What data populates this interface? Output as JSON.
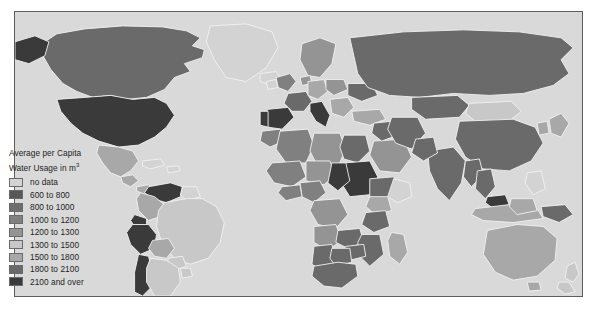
{
  "map": {
    "title_line1": "Average per Capita",
    "title_line2": "Water Usage in m",
    "title_superscript": "3",
    "ocean_color": "#d9d9d9",
    "frame_color": "#5d5d5d",
    "country_border_color": "#f2f2f2"
  },
  "legend": {
    "entries": [
      {
        "label": "no data",
        "color": "#d3d3d3"
      },
      {
        "label": "600 to 800",
        "color": "#585858"
      },
      {
        "label": "800 to 1000",
        "color": "#6e6e6e"
      },
      {
        "label": "1000 to 1200",
        "color": "#808080"
      },
      {
        "label": "1200 to 1300",
        "color": "#949494"
      },
      {
        "label": "1300 to 1500",
        "color": "#c8c8c8"
      },
      {
        "label": "1500 to 1800",
        "color": "#a8a8a8"
      },
      {
        "label": "1800 to 2100",
        "color": "#6a6a6a"
      },
      {
        "label": "2100 and over",
        "color": "#3a3a3a"
      }
    ]
  },
  "chart_data": {
    "type": "map",
    "title": "Average per Capita Water Usage in m3",
    "unit": "m3 per capita per year",
    "projection": "equirectangular-world",
    "classes": [
      {
        "label": "no data",
        "color": "#d3d3d3",
        "min": null,
        "max": null
      },
      {
        "label": "600 to 800",
        "color": "#585858",
        "min": 600,
        "max": 800
      },
      {
        "label": "800 to 1000",
        "color": "#6e6e6e",
        "min": 800,
        "max": 1000
      },
      {
        "label": "1000 to 1200",
        "color": "#808080",
        "min": 1000,
        "max": 1200
      },
      {
        "label": "1200 to 1300",
        "color": "#949494",
        "min": 1200,
        "max": 1300
      },
      {
        "label": "1300 to 1500",
        "color": "#c8c8c8",
        "min": 1300,
        "max": 1500
      },
      {
        "label": "1500 to 1800",
        "color": "#a8a8a8",
        "min": 1500,
        "max": 1800
      },
      {
        "label": "1800 to 2100",
        "color": "#6a6a6a",
        "min": 1800,
        "max": 2100
      },
      {
        "label": "2100 and over",
        "color": "#3a3a3a",
        "min": 2100,
        "max": null
      }
    ],
    "regions": [
      {
        "name": "United States",
        "class": "2100 and over"
      },
      {
        "name": "Canada",
        "class": "1800 to 2100"
      },
      {
        "name": "Mexico",
        "class": "1500 to 1800"
      },
      {
        "name": "Greenland",
        "class": "no data"
      },
      {
        "name": "Brazil",
        "class": "1300 to 1500"
      },
      {
        "name": "Venezuela",
        "class": "2100 and over"
      },
      {
        "name": "Peru",
        "class": "2100 and over"
      },
      {
        "name": "Chile",
        "class": "2100 and over"
      },
      {
        "name": "Argentina",
        "class": "1300 to 1500"
      },
      {
        "name": "Colombia",
        "class": "1500 to 1800"
      },
      {
        "name": "Bolivia",
        "class": "1500 to 1800"
      },
      {
        "name": "Spain",
        "class": "2100 and over"
      },
      {
        "name": "Italy",
        "class": "2100 and over"
      },
      {
        "name": "France",
        "class": "1800 to 2100"
      },
      {
        "name": "Germany",
        "class": "1500 to 1800"
      },
      {
        "name": "United Kingdom",
        "class": "1000 to 1200"
      },
      {
        "name": "Scandinavia",
        "class": "1200 to 1300"
      },
      {
        "name": "Russia",
        "class": "1800 to 2100"
      },
      {
        "name": "China",
        "class": "1800 to 2100"
      },
      {
        "name": "India",
        "class": "1800 to 2100"
      },
      {
        "name": "Mongolia",
        "class": "1300 to 1500"
      },
      {
        "name": "Kazakhstan",
        "class": "1800 to 2100"
      },
      {
        "name": "Japan",
        "class": "1500 to 1800"
      },
      {
        "name": "Indonesia",
        "class": "1500 to 1800"
      },
      {
        "name": "Malaysia",
        "class": "2100 and over"
      },
      {
        "name": "Australia",
        "class": "1500 to 1800"
      },
      {
        "name": "New Zealand",
        "class": "1300 to 1500"
      },
      {
        "name": "Papua New Guinea",
        "class": "1800 to 2100"
      },
      {
        "name": "Sudan",
        "class": "2100 and over"
      },
      {
        "name": "Egypt",
        "class": "1800 to 2100"
      },
      {
        "name": "Algeria",
        "class": "1000 to 1200"
      },
      {
        "name": "Libya",
        "class": "1200 to 1300"
      },
      {
        "name": "Nigeria",
        "class": "1000 to 1200"
      },
      {
        "name": "Ethiopia",
        "class": "1800 to 2100"
      },
      {
        "name": "Kenya",
        "class": "1500 to 1800"
      },
      {
        "name": "Tanzania",
        "class": "1800 to 2100"
      },
      {
        "name": "Angola",
        "class": "1200 to 1300"
      },
      {
        "name": "South Africa",
        "class": "1800 to 2100"
      },
      {
        "name": "Madagascar",
        "class": "1500 to 1800"
      },
      {
        "name": "Saudi Arabia",
        "class": "1200 to 1300"
      },
      {
        "name": "Iran",
        "class": "1800 to 2100"
      },
      {
        "name": "Turkey",
        "class": "1500 to 1800"
      }
    ]
  }
}
